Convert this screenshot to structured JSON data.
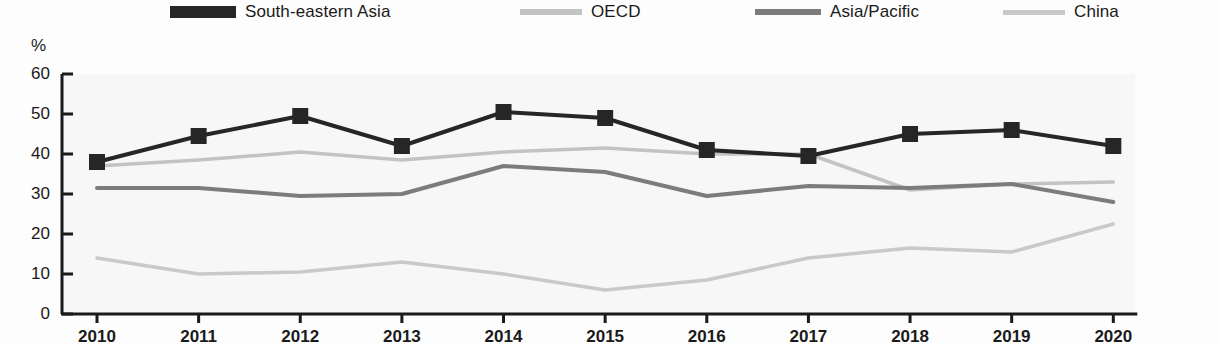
{
  "chart_data": {
    "type": "line",
    "title": "",
    "xlabel": "",
    "ylabel": "%",
    "ylim": [
      0,
      60
    ],
    "yticks": [
      0,
      10,
      20,
      30,
      40,
      50,
      60
    ],
    "grid": false,
    "legend_position": "top",
    "categories": [
      "2010",
      "2011",
      "2012",
      "2013",
      "2014",
      "2015",
      "2016",
      "2017",
      "2018",
      "2019",
      "2020"
    ],
    "series": [
      {
        "name": "South-eastern Asia",
        "color": "#262626",
        "marker": "square",
        "line_width": 4,
        "values": [
          38,
          44.5,
          49.5,
          42,
          50.5,
          49,
          41,
          39.5,
          45,
          46,
          42
        ]
      },
      {
        "name": "OECD",
        "color": "#c3c3c3",
        "marker": "none",
        "line_width": 3.5,
        "values": [
          37,
          38.5,
          40.5,
          38.5,
          40.5,
          41.5,
          40,
          40,
          31,
          32.5,
          33
        ]
      },
      {
        "name": "Asia/Pacific",
        "color": "#7c7c7c",
        "marker": "none",
        "line_width": 4,
        "values": [
          31.5,
          31.5,
          29.5,
          30,
          37,
          35.5,
          29.5,
          32,
          31.5,
          32.5,
          28
        ]
      },
      {
        "name": "China",
        "color": "#c9c9c9",
        "marker": "none",
        "line_width": 3.5,
        "values": [
          14,
          10,
          10.5,
          13,
          10,
          6,
          8.5,
          14,
          16.5,
          15.5,
          22.5
        ]
      }
    ]
  },
  "legend": {
    "items": [
      {
        "label": "South-eastern Asia",
        "color": "#262626",
        "x": 170,
        "swatch_width": 66,
        "swatch_height": 9,
        "marker": true
      },
      {
        "label": "OECD",
        "color": "#c3c3c3",
        "x": 520,
        "swatch_width": 62,
        "swatch_height": 6,
        "marker": false
      },
      {
        "label": "Asia/Pacific",
        "color": "#7c7c7c",
        "x": 755,
        "swatch_width": 66,
        "swatch_height": 6,
        "marker": false
      },
      {
        "label": "China",
        "color": "#c9c9c9",
        "x": 1003,
        "swatch_width": 62,
        "swatch_height": 5,
        "marker": false
      }
    ]
  },
  "axes": {
    "unit_label": "%",
    "y_labels": [
      "60",
      "50",
      "40",
      "30",
      "20",
      "10",
      "0"
    ],
    "x_labels": [
      "2010",
      "2011",
      "2012",
      "2013",
      "2014",
      "2015",
      "2016",
      "2017",
      "2018",
      "2019",
      "2020"
    ]
  },
  "colors": {
    "axis": "#1a1a1a",
    "background": "#fdfdfd",
    "plot_fill": "#f2f2f2"
  }
}
